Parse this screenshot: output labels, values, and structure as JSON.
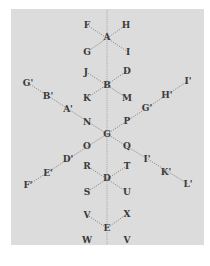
{
  "diagram": {
    "background": "#dcdcdc",
    "line_color": "#7a7a7a",
    "label_color": "#3a3a3a",
    "axis": {
      "x": 107,
      "y1": 10,
      "y2": 245
    },
    "nodes": [
      {
        "id": "A",
        "label": "A",
        "x": 107,
        "y": 37
      },
      {
        "id": "F",
        "label": "F",
        "x": 87,
        "y": 25
      },
      {
        "id": "H",
        "label": "H",
        "x": 126,
        "y": 25
      },
      {
        "id": "G1",
        "label": "G",
        "x": 87,
        "y": 52
      },
      {
        "id": "I1",
        "label": "I",
        "x": 128,
        "y": 52
      },
      {
        "id": "B",
        "label": "B",
        "x": 107,
        "y": 85
      },
      {
        "id": "J",
        "label": "J",
        "x": 86,
        "y": 72
      },
      {
        "id": "D1",
        "label": "D",
        "x": 127,
        "y": 71
      },
      {
        "id": "K",
        "label": "K",
        "x": 87,
        "y": 98
      },
      {
        "id": "M",
        "label": "M",
        "x": 127,
        "y": 98
      },
      {
        "id": "Gp",
        "label": "G'",
        "x": 28,
        "y": 83
      },
      {
        "id": "Bp",
        "label": "B'",
        "x": 48,
        "y": 96
      },
      {
        "id": "Ap",
        "label": "A'",
        "x": 68,
        "y": 109
      },
      {
        "id": "N",
        "label": "N",
        "x": 87,
        "y": 122
      },
      {
        "id": "G",
        "label": "G",
        "x": 107,
        "y": 134
      },
      {
        "id": "P",
        "label": "P",
        "x": 127,
        "y": 121
      },
      {
        "id": "Gp2",
        "label": "G'",
        "x": 147,
        "y": 108
      },
      {
        "id": "Hp",
        "label": "H'",
        "x": 167,
        "y": 95
      },
      {
        "id": "Ip",
        "label": "I'",
        "x": 188,
        "y": 81
      },
      {
        "id": "O",
        "label": "O",
        "x": 87,
        "y": 146
      },
      {
        "id": "Dp",
        "label": "D'",
        "x": 68,
        "y": 159
      },
      {
        "id": "Ep",
        "label": "E'",
        "x": 48,
        "y": 173
      },
      {
        "id": "Fp",
        "label": "F'",
        "x": 28,
        "y": 185
      },
      {
        "id": "Q",
        "label": "Q",
        "x": 127,
        "y": 146
      },
      {
        "id": "Ip2",
        "label": "I'",
        "x": 147,
        "y": 159
      },
      {
        "id": "Kp",
        "label": "K'",
        "x": 166,
        "y": 172
      },
      {
        "id": "Lp",
        "label": "L'",
        "x": 188,
        "y": 184
      },
      {
        "id": "D",
        "label": "D",
        "x": 107,
        "y": 178
      },
      {
        "id": "R",
        "label": "R",
        "x": 87,
        "y": 166
      },
      {
        "id": "T",
        "label": "T",
        "x": 127,
        "y": 166
      },
      {
        "id": "S",
        "label": "S",
        "x": 87,
        "y": 192
      },
      {
        "id": "U",
        "label": "U",
        "x": 127,
        "y": 192
      },
      {
        "id": "E",
        "label": "E",
        "x": 107,
        "y": 228
      },
      {
        "id": "V1",
        "label": "V",
        "x": 87,
        "y": 215
      },
      {
        "id": "X",
        "label": "X",
        "x": 127,
        "y": 214
      },
      {
        "id": "W",
        "label": "W",
        "x": 87,
        "y": 240
      },
      {
        "id": "V2",
        "label": "V",
        "x": 127,
        "y": 240
      }
    ],
    "edges": [
      [
        "F",
        "I1"
      ],
      [
        "H",
        "G1"
      ],
      [
        "J",
        "M"
      ],
      [
        "D1",
        "K"
      ],
      [
        "Gp",
        "G"
      ],
      [
        "G",
        "Ip"
      ],
      [
        "Fp",
        "G"
      ],
      [
        "G",
        "Lp"
      ],
      [
        "R",
        "U"
      ],
      [
        "T",
        "S"
      ],
      [
        "V1",
        "E"
      ],
      [
        "X",
        "E"
      ]
    ]
  }
}
